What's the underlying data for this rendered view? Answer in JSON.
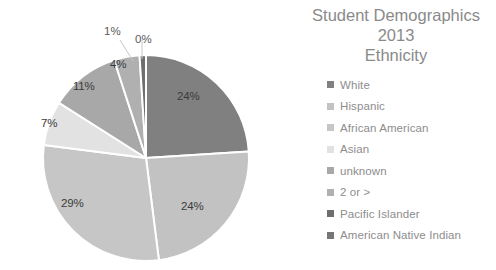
{
  "chart_data": {
    "type": "pie",
    "title": "Student Demographics 2013 Ethnicity",
    "title_lines": [
      "Student Demographics",
      "2013",
      "Ethnicity"
    ],
    "categories": [
      "White",
      "Hispanic",
      "African American",
      "Asian",
      "unknown",
      "2 or >",
      "Pacific Islander",
      "American Native Indian"
    ],
    "values": [
      24,
      24,
      29,
      7,
      11,
      4,
      1,
      0
    ],
    "data_labels": [
      "24%",
      "24%",
      "29%",
      "7%",
      "11%",
      "4%",
      "1%",
      "0%"
    ],
    "colors": [
      "#808080",
      "#c2c2c2",
      "#c6c6c6",
      "#e2e2e2",
      "#a8a8a8",
      "#b0b0b0",
      "#6e6e6e",
      "#767676"
    ],
    "slice_separator_color": "#ffffff",
    "background": "#ffffff",
    "legend_position": "right",
    "grid": false,
    "xlabel": "",
    "ylabel": ""
  },
  "legend": {
    "items": [
      {
        "label": "White",
        "color": "#808080",
        "value": "24%"
      },
      {
        "label": "Hispanic",
        "color": "#c2c2c2",
        "value": "24%"
      },
      {
        "label": "African American",
        "color": "#c6c6c6",
        "value": "29%"
      },
      {
        "label": "Asian",
        "color": "#e2e2e2",
        "value": "7%"
      },
      {
        "label": "unknown",
        "color": "#a8a8a8",
        "value": "11%"
      },
      {
        "label": "2 or >",
        "color": "#b0b0b0",
        "value": "4%"
      },
      {
        "label": "Pacific Islander",
        "color": "#6e6e6e",
        "value": "1%"
      },
      {
        "label": "American Native Indian",
        "color": "#767676",
        "value": "0%"
      }
    ]
  },
  "labels": {
    "white": "24%",
    "hispanic": "24%",
    "african_american": "29%",
    "asian": "7%",
    "unknown": "11%",
    "two_or_more": "4%",
    "pacific_islander": "1%",
    "american_native_indian": "0%"
  }
}
